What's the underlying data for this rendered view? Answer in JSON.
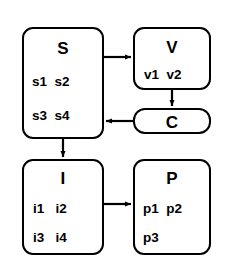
{
  "diagram": {
    "type": "block-flow-diagram",
    "background_color": "#ffffff",
    "stroke_color": "#000000",
    "nodes": [
      {
        "id": "S",
        "title": "S",
        "rows": [
          "s1  s2",
          "s3  s4"
        ],
        "items": [
          "s1",
          "s2",
          "s3",
          "s4"
        ]
      },
      {
        "id": "V",
        "title": "V",
        "rows": [
          "v1  v2"
        ],
        "items": [
          "v1",
          "v2"
        ]
      },
      {
        "id": "C",
        "title": "C",
        "rows": [],
        "items": []
      },
      {
        "id": "I",
        "title": "I",
        "rows": [
          "i1   i2",
          "i3   i4"
        ],
        "items": [
          "i1",
          "i2",
          "i3",
          "i4"
        ]
      },
      {
        "id": "P",
        "title": "P",
        "rows": [
          "p1  p2",
          "p3"
        ],
        "items": [
          "p1",
          "p2",
          "p3"
        ]
      }
    ],
    "edges": [
      {
        "from": "S",
        "to": "V",
        "direction": "right"
      },
      {
        "from": "V",
        "to": "C",
        "direction": "down"
      },
      {
        "from": "C",
        "to": "S",
        "direction": "left"
      },
      {
        "from": "S",
        "to": "I",
        "direction": "down"
      },
      {
        "from": "I",
        "to": "P",
        "direction": "right"
      }
    ]
  }
}
